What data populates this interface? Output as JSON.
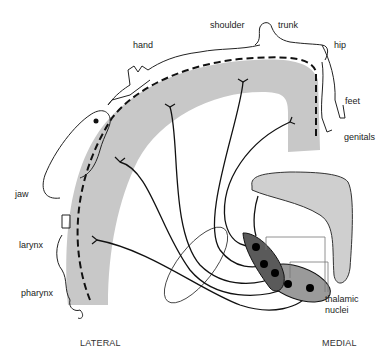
{
  "diagram": {
    "type": "somatotopic projection of thalamic nuclei to somatosensory cortex",
    "body_part_labels": [
      {
        "id": "hand",
        "text": "hand"
      },
      {
        "id": "shoulder",
        "text": "shoulder"
      },
      {
        "id": "trunk",
        "text": "trunk"
      },
      {
        "id": "hip",
        "text": "hip"
      },
      {
        "id": "feet",
        "text": "feet"
      },
      {
        "id": "genitals",
        "text": "genitals"
      },
      {
        "id": "jaw",
        "text": "jaw"
      },
      {
        "id": "larynx",
        "text": "larynx"
      },
      {
        "id": "pharynx",
        "text": "pharynx"
      }
    ],
    "structure_labels": {
      "thalamic_nuclei_line1": "thalamic",
      "thalamic_nuclei_line2": "nuclei"
    },
    "axis_labels": {
      "lateral": "LATERAL",
      "medial": "MEDIAL"
    },
    "colors": {
      "cortex_band": "#c8c8c8",
      "medial_shape": "#cfcfcf",
      "nucleus_dark": "#5a5a5a",
      "nucleus_light": "#9a9a9a",
      "line": "#111111"
    }
  }
}
